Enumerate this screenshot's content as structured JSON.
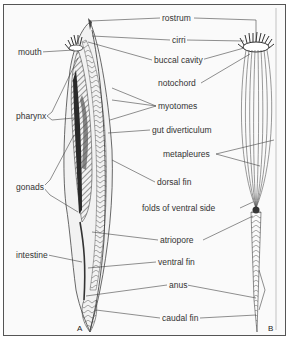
{
  "diagram": {
    "figures": [
      {
        "id": "A",
        "label": "A",
        "view": "lateral"
      },
      {
        "id": "B",
        "label": "B",
        "view": "ventral"
      }
    ],
    "labels": {
      "rostrum": "rostrum",
      "cirri": "cirri",
      "mouth": "mouth",
      "buccal_cavity": "buccal cavity",
      "notochord": "notochord",
      "pharynx": "pharynx",
      "myotomes": "myotomes",
      "gut_diverticulum": "gut diverticulum",
      "metapleures": "metapleures",
      "gonads": "gonads",
      "dorsal_fin": "dorsal fin",
      "folds_of_ventral_side": "folds of ventral side",
      "atriopore": "atriopore",
      "intestine": "intestine",
      "ventral_fin": "ventral fin",
      "anus": "anus",
      "caudal_fin": "caudal fin"
    },
    "colors": {
      "line": "#444444",
      "pharynx_dark": "#2a2a2a",
      "hatch": "#666666",
      "background": "#fafafa"
    }
  }
}
